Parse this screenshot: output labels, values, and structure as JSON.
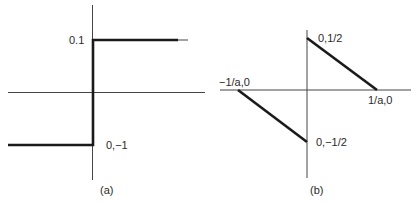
{
  "figure": {
    "panel_a": {
      "caption": "(a)",
      "labels": {
        "upper": "0.1",
        "lower": "0,−1"
      },
      "description": "Step function: value -1 for x<0, jumps at x=0 to upper level"
    },
    "panel_b": {
      "caption": "(b)",
      "labels": {
        "top": "0,1/2",
        "bottom": "0,−1/2",
        "left": "−1/a,0",
        "right": "1/a,0"
      },
      "description": "Sawtooth-like function: line from (-1/a,0) down to (0,-1/2), jump to (0,1/2), line down to (1/a,0)"
    }
  }
}
